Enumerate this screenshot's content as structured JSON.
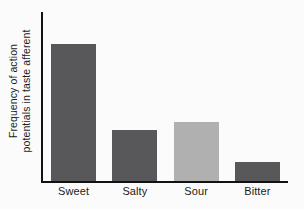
{
  "chart_data": {
    "type": "bar",
    "title": "",
    "subtitle": "",
    "xlabel": "",
    "ylabel_line1": "Frequency of action",
    "ylabel_line2": "potentials in taste afferent",
    "ylabel": "Frequency of action potentials in taste afferent",
    "categories": [
      "Sweet",
      "Salty",
      "Sour",
      "Bitter"
    ],
    "values": [
      81,
      30,
      35,
      11
    ],
    "value_unit": "relative frequency (% of axis height)",
    "ylim": [
      0,
      100
    ],
    "y_ticks": [],
    "y_tick_labels": [],
    "grid": false,
    "legend": false,
    "legend_position": "none",
    "bar_colors": [
      "#58585a",
      "#58585a",
      "#b0b0b0",
      "#58585a"
    ],
    "axis_color": "#121212",
    "background_color": "#fbfbfb",
    "annotations": []
  }
}
